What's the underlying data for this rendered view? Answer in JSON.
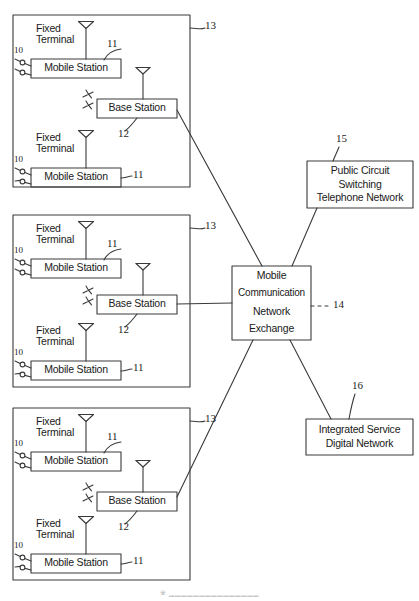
{
  "figure": {
    "caption": "※ ▁▁▁▁▁▁▁▁▁▁▁▁▁▁▁",
    "line_color": "#3a3a3a",
    "text_color": "#1a1a1a",
    "background": "#ffffff"
  },
  "cell_blocks": [
    {
      "ref": "13",
      "base_station": {
        "label": "Base Station",
        "ref": "12"
      },
      "mobile_stations": [
        {
          "label": "Mobile Station",
          "ref": "11",
          "terminal_label": "Fixed\nTerminal",
          "terminal_ref": "10"
        },
        {
          "label": "Mobile Station",
          "ref": "11",
          "terminal_label": "Fixed\nTerminal",
          "terminal_ref": "10"
        }
      ]
    },
    {
      "ref": "13",
      "base_station": {
        "label": "Base Station",
        "ref": "12"
      },
      "mobile_stations": [
        {
          "label": "Mobile Station",
          "ref": "11",
          "terminal_label": "Fixed\nTerminal",
          "terminal_ref": "10"
        },
        {
          "label": "Mobile Station",
          "ref": "11",
          "terminal_label": "Fixed\nTerminal",
          "terminal_ref": "10"
        }
      ]
    },
    {
      "ref": "13",
      "base_station": {
        "label": "Base Station",
        "ref": "12"
      },
      "mobile_stations": [
        {
          "label": "Mobile Station",
          "ref": "11",
          "terminal_label": "Fixed\nTerminal",
          "terminal_ref": "10"
        },
        {
          "label": "Mobile Station",
          "ref": "11",
          "terminal_label": "Fixed\nTerminal",
          "terminal_ref": "10"
        }
      ]
    }
  ],
  "exchange": {
    "ref": "14",
    "line1": "Mobile",
    "line2": "Communication",
    "line3": "Network",
    "line4": "Exchange"
  },
  "pstn": {
    "ref": "15",
    "line1": "Public Circuit",
    "line2": "Switching",
    "line3": "Telephone Network"
  },
  "isdn": {
    "ref": "16",
    "line1": "Integrated Service",
    "line2": "Digital Network"
  },
  "icons": {
    "antenna": "antenna-icon",
    "radio_waves": "radio-wave-icon",
    "terminal_connector": "terminal-connector-icon"
  }
}
